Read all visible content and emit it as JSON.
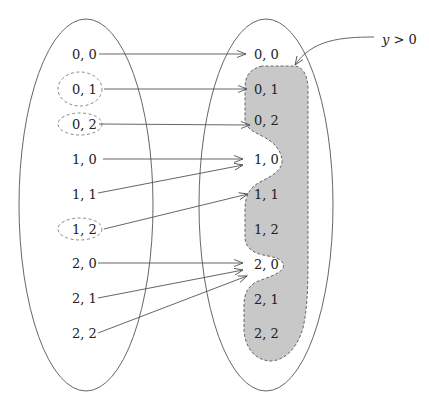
{
  "diagram": {
    "domain_set_label": "domain",
    "codomain_set_label": "codomain",
    "predicate_label": "y > 0",
    "predicate_label_parts": {
      "var": "y",
      "rest": " > 0"
    },
    "colors": {
      "stroke": "#555555",
      "dashed": "#777777",
      "region_fill": "#c8c8c8",
      "text": "#222222"
    },
    "left_elements": [
      {
        "label": "0, 0",
        "circled": false
      },
      {
        "label": "0, 1",
        "circled": true
      },
      {
        "label": "0, 2",
        "circled": true
      },
      {
        "label": "1, 0",
        "circled": false
      },
      {
        "label": "1, 1",
        "circled": false
      },
      {
        "label": "1, 2",
        "circled": true
      },
      {
        "label": "2, 0",
        "circled": false
      },
      {
        "label": "2, 1",
        "circled": false
      },
      {
        "label": "2, 2",
        "circled": false
      }
    ],
    "right_elements": [
      {
        "label": "0, 0",
        "in_region": false
      },
      {
        "label": "0, 1",
        "in_region": true
      },
      {
        "label": "0, 2",
        "in_region": true
      },
      {
        "label": "1, 0",
        "in_region": false
      },
      {
        "label": "1, 1",
        "in_region": true
      },
      {
        "label": "1, 2",
        "in_region": true
      },
      {
        "label": "2, 0",
        "in_region": false
      },
      {
        "label": "2, 1",
        "in_region": true
      },
      {
        "label": "2, 2",
        "in_region": true
      }
    ],
    "mappings": [
      {
        "from": "0, 0",
        "to": "0, 0"
      },
      {
        "from": "0, 1",
        "to": "0, 1"
      },
      {
        "from": "0, 2",
        "to": "0, 2"
      },
      {
        "from": "1, 0",
        "to": "1, 0"
      },
      {
        "from": "1, 1",
        "to": "1, 0"
      },
      {
        "from": "1, 2",
        "to": "1, 1"
      },
      {
        "from": "2, 0",
        "to": "2, 0"
      },
      {
        "from": "2, 1",
        "to": "2, 0"
      },
      {
        "from": "2, 2",
        "to": "2, 0"
      }
    ]
  }
}
